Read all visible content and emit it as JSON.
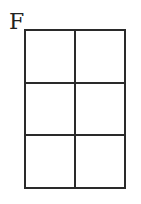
{
  "figure": {
    "label": "F",
    "grid": {
      "rows": 3,
      "cols": 2,
      "cells": [
        {
          "row": 1,
          "col": 1,
          "content": ""
        },
        {
          "row": 1,
          "col": 2,
          "content": ""
        },
        {
          "row": 2,
          "col": 1,
          "content": ""
        },
        {
          "row": 2,
          "col": 2,
          "content": ""
        },
        {
          "row": 3,
          "col": 1,
          "content": ""
        },
        {
          "row": 3,
          "col": 2,
          "content": ""
        }
      ]
    }
  }
}
